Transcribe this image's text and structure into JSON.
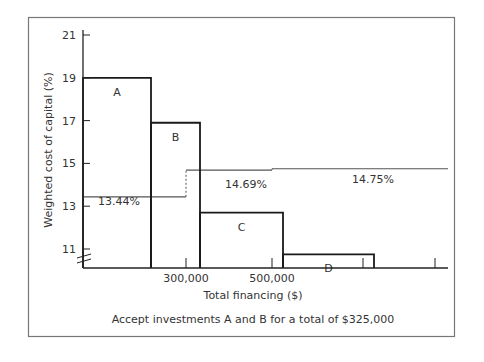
{
  "chart_data": {
    "type": "bar",
    "subtype": "investment-opportunity-schedule-vs-weighted-marginal-cost-of-capital",
    "xlabel": "Total financing ($)",
    "ylabel": "Weighted cost of capital (%)",
    "caption": "Accept investments A and B for a total of $325,000",
    "y_ticks": [
      11,
      13,
      15,
      17,
      19,
      21
    ],
    "x_tick_labels": [
      {
        "value": 300000,
        "label": "300,000"
      },
      {
        "value": 500000,
        "label": "500,000"
      }
    ],
    "ylim": [
      10.2,
      21
    ],
    "axis_break": true,
    "grid": false,
    "ios_bars": [
      {
        "name": "A",
        "x_start": 0,
        "x_end": 200000,
        "return": 19.0
      },
      {
        "name": "B",
        "x_start": 200000,
        "x_end": 325000,
        "return": 16.9
      },
      {
        "name": "C",
        "x_start": 325000,
        "x_end": 525000,
        "return": 12.7
      },
      {
        "name": "D",
        "x_start": 525000,
        "x_end": 725000,
        "return": 10.75
      }
    ],
    "wmcc_segments": [
      {
        "label": "13.44%",
        "x_start": 0,
        "x_end": 300000,
        "value": 13.44
      },
      {
        "label": "14.69%",
        "x_start": 300000,
        "x_end": 500000,
        "value": 14.69
      },
      {
        "label": "14.75%",
        "x_start": 500000,
        "x_end": 900000,
        "value": 14.75
      }
    ]
  },
  "colors": {
    "axis": "#222222",
    "bar_outline": "#1a1a1a",
    "wmcc_line": "#555555",
    "frame": "#777777",
    "text": "#333333"
  }
}
